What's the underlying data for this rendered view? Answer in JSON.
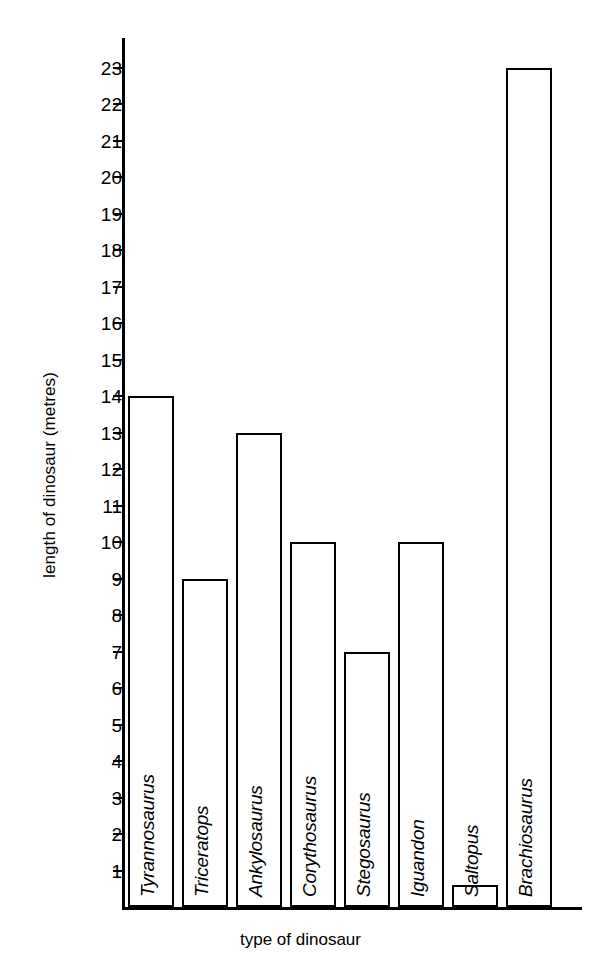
{
  "chart_data": {
    "type": "bar",
    "title": "",
    "xlabel": "type of dinosaur",
    "ylabel": "length of dinosaur (metres)",
    "categories": [
      "Tyrannosaurus",
      "Triceratops",
      "Ankylosaurus",
      "Corythosaurus",
      "Stegosaurus",
      "Iguandon",
      "Saltopus",
      "Brachiosaurus"
    ],
    "values": [
      14,
      9,
      13,
      10,
      7,
      10,
      0.6,
      23
    ],
    "ylim": [
      0,
      23
    ],
    "yticks": [
      1,
      2,
      3,
      4,
      5,
      6,
      7,
      8,
      9,
      10,
      11,
      12,
      13,
      14,
      15,
      16,
      17,
      18,
      19,
      20,
      21,
      22,
      23
    ],
    "ytick_labels": [
      "1",
      "2",
      "3",
      "4",
      "5",
      "6",
      "7",
      "8",
      "9",
      "10",
      "11",
      "12",
      "13",
      "14",
      "15",
      "16",
      "17",
      "18",
      "19",
      "20",
      "21",
      "22",
      "23"
    ],
    "grid": false,
    "legend": false,
    "bar_fill_color": "#ffffff",
    "bar_edge_color": "#000000",
    "axis_color": "#000000"
  },
  "artifact": {
    "top_strip_text": ""
  }
}
